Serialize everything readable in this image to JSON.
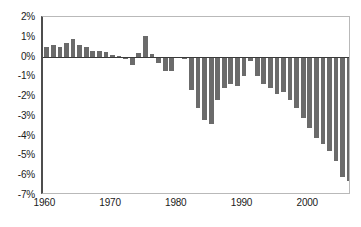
{
  "chart_data": {
    "type": "bar",
    "title": "",
    "subtitle": "",
    "xlabel": "",
    "ylabel": "",
    "ylim": [
      -7,
      2
    ],
    "xlim": [
      1959.5,
      2006.5
    ],
    "grid": false,
    "legend": null,
    "bar_color": "#6b6b6b",
    "y_tick_labels": [
      "2%",
      "1%",
      "0%",
      "-1%",
      "-2%",
      "-3%",
      "-4%",
      "-5%",
      "-6%",
      "-7%"
    ],
    "y_tick_values": [
      2,
      1,
      0,
      -1,
      -2,
      -3,
      -4,
      -5,
      -6,
      -7
    ],
    "x_tick_labels": [
      "1960",
      "1970",
      "1980",
      "1990",
      "2000"
    ],
    "x_tick_values": [
      1960,
      1970,
      1980,
      1990,
      2000
    ],
    "categories": [
      "1960",
      "1961",
      "1962",
      "1963",
      "1964",
      "1965",
      "1966",
      "1967",
      "1968",
      "1969",
      "1970",
      "1971",
      "1972",
      "1973",
      "1974",
      "1975",
      "1976",
      "1977",
      "1978",
      "1979",
      "1980",
      "1981",
      "1982",
      "1983",
      "1984",
      "1985",
      "1986",
      "1987",
      "1988",
      "1989",
      "1990",
      "1991",
      "1992",
      "1993",
      "1994",
      "1995",
      "1996",
      "1997",
      "1998",
      "1999",
      "2000",
      "2001",
      "2002",
      "2003",
      "2004",
      "2005",
      "2006"
    ],
    "values": [
      0.5,
      0.6,
      0.5,
      0.7,
      0.9,
      0.6,
      0.5,
      0.3,
      0.3,
      0.25,
      0.1,
      0.05,
      -0.1,
      -0.45,
      0.2,
      1.05,
      0.15,
      -0.35,
      -0.75,
      -0.75,
      -0.05,
      -0.1,
      -1.7,
      -2.6,
      -3.2,
      -3.4,
      -2.2,
      -1.6,
      -1.4,
      -1.5,
      -1.0,
      -0.2,
      -1.0,
      -1.4,
      -1.6,
      -1.9,
      -1.8,
      -2.2,
      -2.6,
      -3.1,
      -3.6,
      -4.1,
      -4.4,
      -4.8,
      -5.3,
      -6.1,
      -6.3
    ]
  }
}
